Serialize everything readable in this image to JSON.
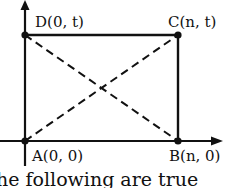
{
  "diagram": {
    "points": {
      "A": {
        "label": "A(0, 0)"
      },
      "B": {
        "label": "B(n, 0)"
      },
      "C": {
        "label": "C(n, t)"
      },
      "D": {
        "label": "D(0, t)"
      }
    },
    "caption_fragment": "he following are true"
  },
  "colors": {
    "ink": "#111111",
    "background": "#ffffff"
  }
}
